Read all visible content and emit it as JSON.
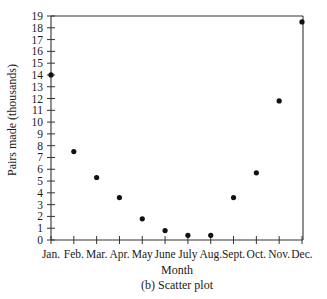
{
  "chart_data": {
    "type": "scatter",
    "title": "",
    "caption": "(b) Scatter plot",
    "xlabel": "Month",
    "ylabel": "Pairs made (thousands)",
    "categories": [
      "Jan.",
      "Feb.",
      "Mar.",
      "Apr.",
      "May",
      "June",
      "July",
      "Aug.",
      "Sept.",
      "Oct.",
      "Nov.",
      "Dec."
    ],
    "values": [
      14.0,
      7.5,
      5.3,
      3.6,
      1.8,
      0.8,
      0.4,
      0.4,
      3.6,
      5.7,
      11.8,
      18.5
    ],
    "ylim": [
      0,
      19
    ],
    "yticks": [
      0,
      1,
      2,
      3,
      4,
      5,
      6,
      7,
      8,
      9,
      10,
      11,
      12,
      13,
      14,
      15,
      16,
      17,
      18,
      19
    ],
    "grid": false,
    "legend": null,
    "marker_color": "#111111",
    "axis_color": "#333333"
  }
}
